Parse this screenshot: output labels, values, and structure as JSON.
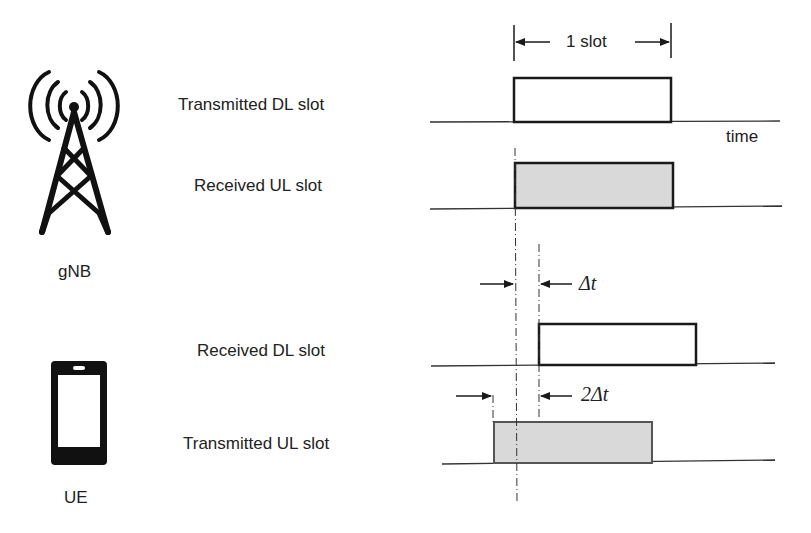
{
  "nodes": {
    "gnb": {
      "label": "gNB",
      "icon": "cell-tower-icon"
    },
    "ue": {
      "label": "UE",
      "icon": "smartphone-icon"
    }
  },
  "rows": [
    {
      "label": "Transmitted DL slot",
      "fill": "#ffffff"
    },
    {
      "label": "Received UL slot",
      "fill": "#d9d9d9"
    },
    {
      "label": "Received DL slot",
      "fill": "#ffffff"
    },
    {
      "label": "Transmitted UL slot",
      "fill": "#d9d9d9"
    }
  ],
  "annotations": {
    "slot_width": "1 slot",
    "axis": "time",
    "delay": "Δt",
    "double_delay": "2Δt"
  },
  "colors": {
    "stroke": "#1a1a1a",
    "shaded_slot": "#d9d9d9"
  }
}
